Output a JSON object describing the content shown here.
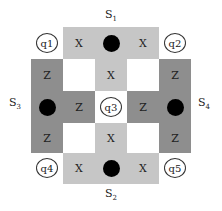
{
  "colors": {
    "x_plaquette": "#c6c6c6",
    "z_plaquette": "#8e8e8e",
    "background": "#ffffff",
    "ancilla_dot": "#000000"
  },
  "stabilizers": [
    {
      "id": "S1",
      "base": "S",
      "sub": "1",
      "position": "top"
    },
    {
      "id": "S2",
      "base": "S",
      "sub": "2",
      "position": "bottom"
    },
    {
      "id": "S3",
      "base": "S",
      "sub": "3",
      "position": "left"
    },
    {
      "id": "S4",
      "base": "S",
      "sub": "4",
      "position": "right"
    }
  ],
  "qubits": [
    "q1",
    "q2",
    "q3",
    "q4",
    "q5"
  ],
  "operators": {
    "x": "X",
    "z": "Z"
  }
}
